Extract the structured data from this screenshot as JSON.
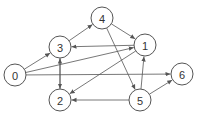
{
  "graph": {
    "nodes": [
      {
        "id": "0",
        "label": "0",
        "x": 15,
        "y": 75
      },
      {
        "id": "1",
        "label": "1",
        "x": 145,
        "y": 45
      },
      {
        "id": "2",
        "label": "2",
        "x": 60,
        "y": 100
      },
      {
        "id": "3",
        "label": "3",
        "x": 60,
        "y": 47
      },
      {
        "id": "4",
        "label": "4",
        "x": 102,
        "y": 18
      },
      {
        "id": "5",
        "label": "5",
        "x": 140,
        "y": 100
      },
      {
        "id": "6",
        "label": "6",
        "x": 182,
        "y": 74
      }
    ],
    "edges": [
      {
        "from": "0",
        "to": "3"
      },
      {
        "from": "0",
        "to": "1"
      },
      {
        "from": "0",
        "to": "6"
      },
      {
        "from": "3",
        "to": "4"
      },
      {
        "from": "3",
        "to": "2"
      },
      {
        "from": "2",
        "to": "3"
      },
      {
        "from": "4",
        "to": "1"
      },
      {
        "from": "4",
        "to": "5"
      },
      {
        "from": "1",
        "to": "3"
      },
      {
        "from": "1",
        "to": "2"
      },
      {
        "from": "5",
        "to": "1"
      },
      {
        "from": "5",
        "to": "2"
      },
      {
        "from": "5",
        "to": "6"
      }
    ],
    "node_radius": 11,
    "stroke_color": "#555555"
  }
}
